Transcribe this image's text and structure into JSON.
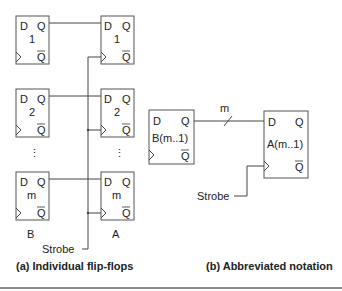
{
  "figure": {
    "part_a": {
      "caption": "(a) Individual flip-flops",
      "register_b_label": "B",
      "register_a_label": "A",
      "strobe_label": "Strobe",
      "flipflops_b": [
        {
          "d": "D",
          "q": "Q",
          "qbar": "Q",
          "index": "1"
        },
        {
          "d": "D",
          "q": "Q",
          "qbar": "Q",
          "index": "2"
        },
        {
          "d": "D",
          "q": "Q",
          "qbar": "Q",
          "index": "m"
        }
      ],
      "flipflops_a": [
        {
          "d": "D",
          "q": "Q",
          "qbar": "Q",
          "index": "1"
        },
        {
          "d": "D",
          "q": "Q",
          "qbar": "Q",
          "index": "2"
        },
        {
          "d": "D",
          "q": "Q",
          "qbar": "Q",
          "index": "m"
        }
      ],
      "ellipsis": "⋮"
    },
    "part_b": {
      "caption": "(b) Abbreviated notation",
      "bus_width_label": "m",
      "strobe_label": "Strobe",
      "register_b": {
        "d": "D",
        "q": "Q",
        "qbar": "Q",
        "name": "B(m..1)"
      },
      "register_a": {
        "d": "D",
        "q": "Q",
        "qbar": "Q",
        "name": "A(m..1)"
      }
    }
  }
}
